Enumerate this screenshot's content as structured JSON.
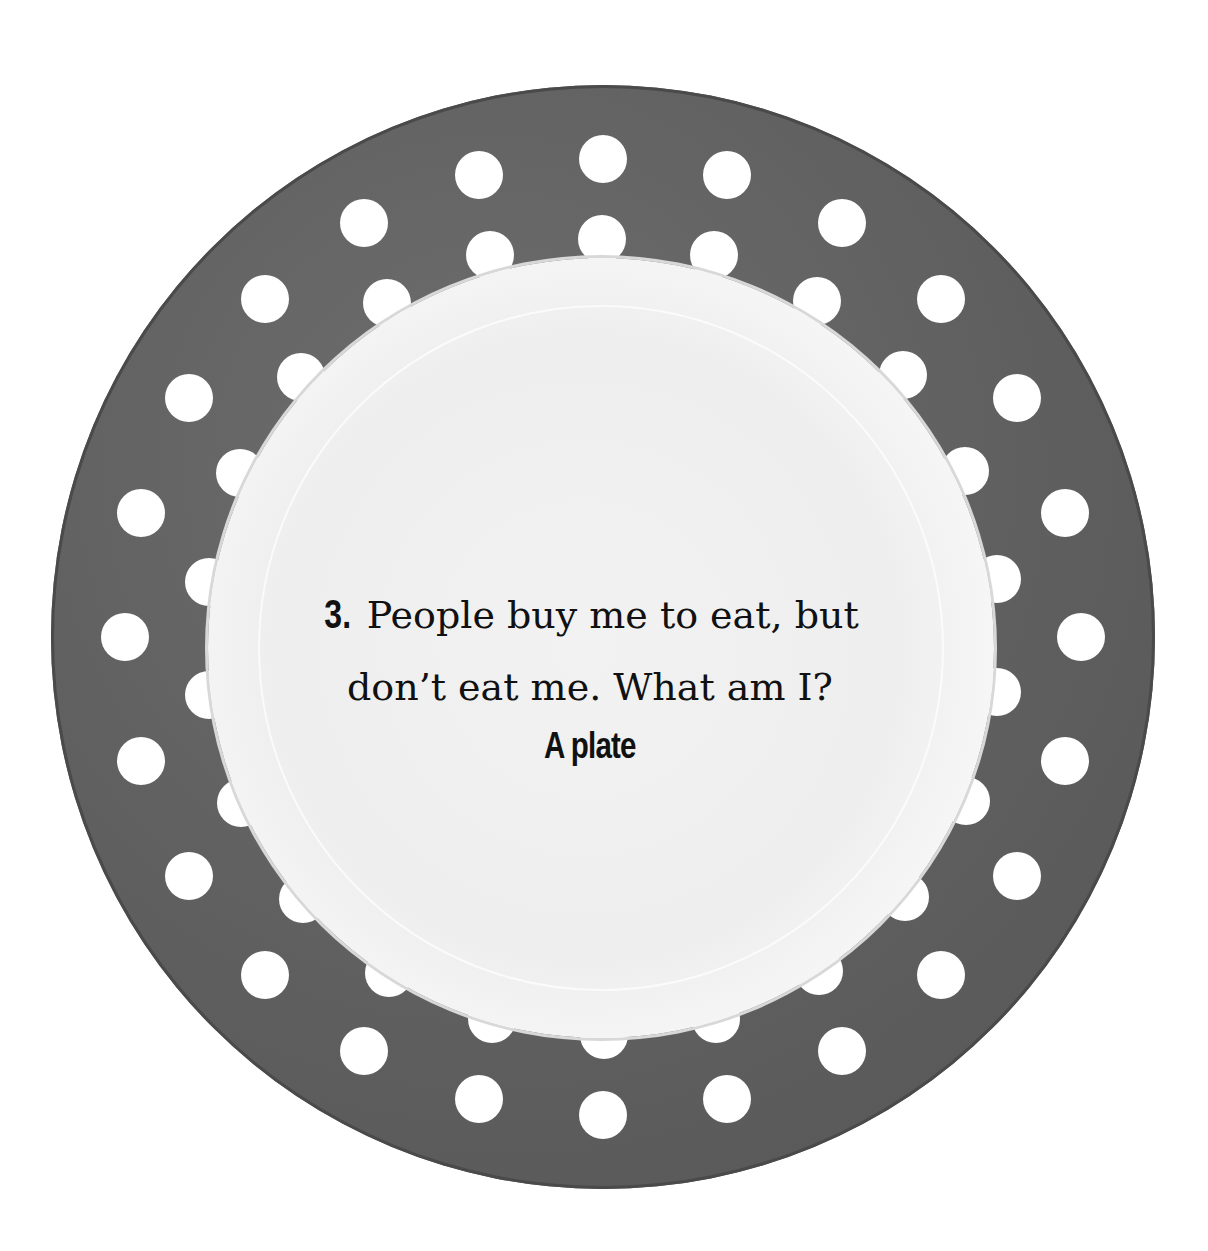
{
  "riddle": {
    "number": "3.",
    "line1": "People buy me to eat, but",
    "line2": "don’t eat me. What am I?",
    "answer": "A plate"
  },
  "plate": {
    "rim_color": "#5f5f5f",
    "well_color": "#efefef",
    "dot_color": "#ffffff",
    "center": [
      603,
      637
    ],
    "rings": [
      {
        "radius": 478,
        "count": 24,
        "offset_deg": 0
      },
      {
        "radius": 398,
        "count": 22,
        "offset_deg": 8
      }
    ]
  }
}
